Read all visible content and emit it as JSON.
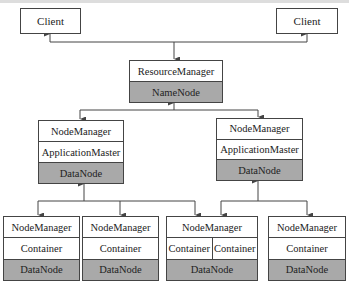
{
  "diagram": {
    "type": "hadoop-yarn-hdfs-architecture",
    "clients": [
      {
        "label": "Client"
      },
      {
        "label": "Client"
      }
    ],
    "master": {
      "top": "ResourceManager",
      "bottom": "NameNode"
    },
    "app_nodes": [
      {
        "top": "NodeManager",
        "middle": "ApplicationMaster",
        "bottom": "DataNode"
      },
      {
        "top": "NodeManager",
        "middle": "ApplicationMaster",
        "bottom": "DataNode"
      }
    ],
    "worker_nodes": [
      {
        "top": "NodeManager",
        "containers": [
          "Container"
        ],
        "bottom": "DataNode"
      },
      {
        "top": "NodeManager",
        "containers": [
          "Container"
        ],
        "bottom": "DataNode"
      },
      {
        "top": "NodeManager",
        "containers": [
          "Container",
          "Container"
        ],
        "bottom": "DataNode"
      },
      {
        "top": "NodeManager",
        "containers": [
          "Container"
        ],
        "bottom": "DataNode"
      }
    ],
    "colors": {
      "line": "#444444",
      "gray_cell": "#a9a9a9",
      "background": "#ffffff"
    }
  }
}
